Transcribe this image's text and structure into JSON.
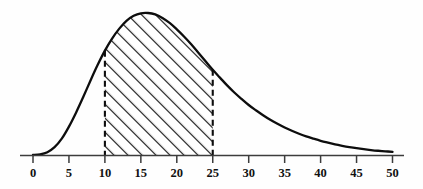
{
  "chart_data": {
    "type": "area",
    "title": "",
    "subtitle": "",
    "xlabel": "",
    "ylabel": "",
    "xlim": [
      -2,
      52
    ],
    "ylim": [
      0,
      1.05
    ],
    "grid": false,
    "legend": null,
    "curve_description": "Right-skewed unimodal probability density curve",
    "peak_x": 15.7,
    "peak_y": 1.0,
    "shaded_region": {
      "from": 10,
      "to": 25,
      "fill_style": "diagonal-hatch",
      "hatch_angle_deg": 45,
      "hatch_spacing_px": 7,
      "boundary_style": "dashed-vertical-lines"
    },
    "x_ticks": [
      0,
      5,
      10,
      15,
      20,
      25,
      30,
      35,
      40,
      45,
      50
    ],
    "x_tick_labels": [
      "0",
      "5",
      "10",
      "15",
      "20",
      "25",
      "30",
      "35",
      "40",
      "45",
      "50"
    ],
    "y_ticks": [],
    "y_tick_labels": [],
    "series": [
      {
        "name": "density",
        "x": [
          0,
          1,
          2,
          3,
          4,
          5,
          6,
          7,
          8,
          9,
          10,
          11,
          12,
          13,
          14,
          15,
          16,
          17,
          18,
          19,
          20,
          21,
          22,
          23,
          24,
          25,
          26,
          27,
          28,
          29,
          30,
          31,
          32,
          33,
          34,
          35,
          36,
          37,
          38,
          39,
          40,
          41,
          42,
          43,
          44,
          45,
          46,
          47,
          48,
          49,
          50
        ],
        "values": [
          0.0,
          0.005,
          0.02,
          0.055,
          0.115,
          0.2,
          0.3,
          0.41,
          0.525,
          0.635,
          0.735,
          0.82,
          0.89,
          0.945,
          0.98,
          0.998,
          1.0,
          0.99,
          0.965,
          0.93,
          0.885,
          0.835,
          0.78,
          0.72,
          0.66,
          0.6,
          0.545,
          0.49,
          0.44,
          0.395,
          0.352,
          0.315,
          0.28,
          0.248,
          0.22,
          0.194,
          0.171,
          0.15,
          0.131,
          0.115,
          0.1,
          0.087,
          0.075,
          0.065,
          0.056,
          0.048,
          0.041,
          0.035,
          0.03,
          0.026,
          0.022
        ]
      }
    ],
    "shaded_area_boundary_values": {
      "at_x_10": 0.735,
      "at_x_25": 0.6
    },
    "colors": {
      "curve": "#0d0d0d",
      "axis": "#3a3a3a",
      "hatch": "#1a1a1a",
      "dashed": "#0d0d0d",
      "background": "#fefefe",
      "tick_label": "#111111"
    }
  },
  "axis": {
    "tick_labels": [
      "0",
      "5",
      "10",
      "15",
      "20",
      "25",
      "30",
      "35",
      "40",
      "45",
      "50"
    ]
  }
}
